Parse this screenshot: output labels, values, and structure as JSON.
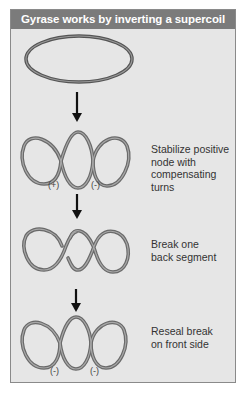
{
  "title": "Gyrase works by inverting a supercoil",
  "colors": {
    "header_bg": "#7b7b7b",
    "panel_bg": "#e6e6e6",
    "strand": "#6e6e6e",
    "arrow": "#111111"
  },
  "steps": [
    {
      "shape": "relaxed-circle",
      "label": "",
      "signs": []
    },
    {
      "shape": "figure-three-loops",
      "label": "Stabilize positive node with compensating turns",
      "label_lines": [
        "Stabilize positive",
        "node with",
        "compensating",
        "turns"
      ],
      "signs": [
        "(+)",
        "(-)"
      ]
    },
    {
      "shape": "broken-back-segment",
      "label": "Break one back segment",
      "label_lines": [
        "Break one",
        "back segment"
      ],
      "signs": []
    },
    {
      "shape": "figure-three-loops",
      "label": "Reseal break on front side",
      "label_lines": [
        "Reseal break",
        "on front side"
      ],
      "signs": [
        "(-)",
        "(-)"
      ]
    }
  ],
  "arrows": [
    "down-arrow",
    "down-arrow",
    "down-arrow"
  ]
}
